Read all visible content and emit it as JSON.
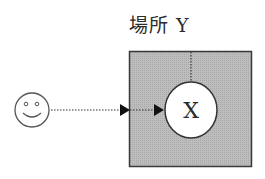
{
  "diagram": {
    "place_label_prefix": "場所",
    "place_label_suffix": "Y",
    "node_label": "X",
    "actor_icon": "smiley-face-icon",
    "colors": {
      "place_fill": "#b9b9b9",
      "place_border": "#3a3a3a",
      "node_fill": "#ffffff",
      "line": "#222222",
      "text": "#2b2b2b"
    }
  }
}
